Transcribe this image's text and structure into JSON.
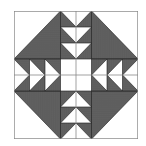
{
  "figure": {
    "title": "Basket quilt block",
    "colors": {
      "dark_fabric": "#555555",
      "light_fabric": "#ffffff",
      "outline": "#222222",
      "grid_line": "#888888"
    },
    "grid": {
      "quadrants": 4,
      "units_per_quadrant": 4
    }
  }
}
